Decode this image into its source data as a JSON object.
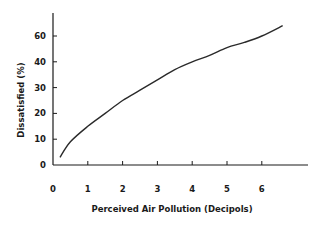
{
  "chart_data": {
    "type": "line",
    "title": "",
    "xlabel": "Perceived Air Pollution (Decipols)",
    "ylabel": "Dissatisfied (%)",
    "x_ticks": [
      0,
      1,
      2,
      3,
      4,
      5,
      6
    ],
    "y_ticks": [
      "0",
      "10",
      "20",
      "30",
      "40",
      "60"
    ],
    "xlim": [
      0,
      7.3
    ],
    "ylim": [
      0,
      70
    ],
    "grid": false,
    "legend": null,
    "series": [
      {
        "name": "Dissatisfied vs perceived air pollution",
        "x": [
          0.2,
          0.5,
          1,
          1.5,
          2,
          2.5,
          3,
          3.5,
          4,
          4.5,
          5,
          5.5,
          6,
          6.6
        ],
        "y": [
          3,
          9,
          15,
          20,
          25,
          29,
          33,
          37,
          40,
          45,
          51,
          55,
          60,
          64
        ]
      }
    ]
  },
  "colors": {
    "line": "#2a2a2a",
    "axis": "#1a1a1a",
    "background": "#ffffff"
  }
}
